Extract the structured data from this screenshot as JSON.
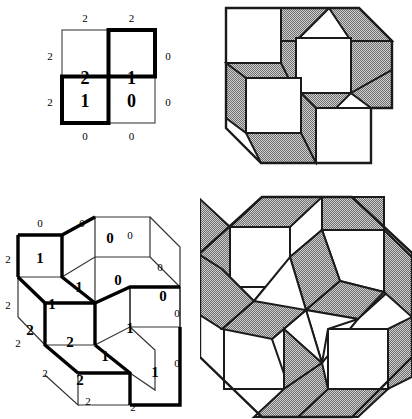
{
  "figure_top_left": {
    "name": "height-function-grid-2x2",
    "cells": [
      {
        "row": 0,
        "col": 0,
        "value": "2"
      },
      {
        "row": 0,
        "col": 1,
        "value": "1"
      },
      {
        "row": 1,
        "col": 0,
        "value": "1"
      },
      {
        "row": 1,
        "col": 1,
        "value": "0"
      }
    ],
    "top_labels": [
      "2",
      "2"
    ],
    "left_labels": [
      "2",
      "2"
    ],
    "right_labels": [
      "0",
      "0"
    ],
    "bottom_labels": [
      "0",
      "0"
    ],
    "bold_path_color": "#000000",
    "grid_line_color": "#555555"
  },
  "figure_top_right": {
    "name": "lozenge-tiling-hexagon",
    "shade_color": "#a9a9a9",
    "white_color": "#ffffff",
    "outline_color": "#1a1a1a",
    "tile_count": 12,
    "white_square_count": 4
  },
  "figure_bottom_left": {
    "name": "height-function-3d-boxes",
    "face_labels": [
      {
        "id": "top-left-top",
        "value": "1"
      },
      {
        "id": "top-left-right",
        "value": "1"
      },
      {
        "id": "upper-right-top",
        "value": "0"
      },
      {
        "id": "upper-right-front",
        "value": "0"
      },
      {
        "id": "right-side",
        "value": "0"
      },
      {
        "id": "mid-left",
        "value": "1"
      },
      {
        "id": "left-side",
        "value": "2"
      },
      {
        "id": "center-front",
        "value": "2"
      },
      {
        "id": "center-right",
        "value": "1"
      },
      {
        "id": "lower-right-top",
        "value": "1"
      },
      {
        "id": "bottom-front",
        "value": "2"
      },
      {
        "id": "lower-right-front",
        "value": "1"
      }
    ],
    "boundary_labels": {
      "top": [
        "0",
        "0",
        "0"
      ],
      "upper_right": [
        "0"
      ],
      "right": [
        "0",
        "0"
      ],
      "left": [
        "2",
        "2"
      ],
      "lower_left": [
        "2",
        "2"
      ],
      "bottom": [
        "2",
        "2"
      ]
    },
    "bold_path_color": "#000000",
    "thin_line_color": "#333333"
  },
  "figure_bottom_right": {
    "name": "rhombus-tiling-octagon",
    "shade_color": "#a9a9a9",
    "white_color": "#ffffff",
    "outline_color": "#1a1a1a",
    "pinwheel_center_rays": 8
  }
}
